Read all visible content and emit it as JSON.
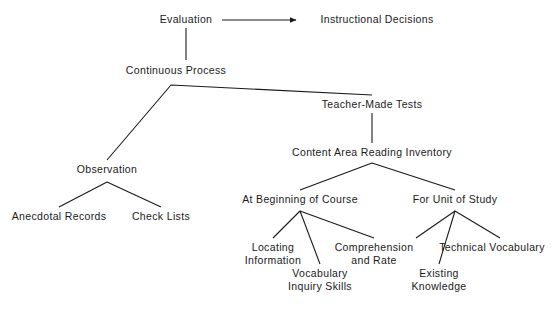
{
  "diagram": {
    "type": "tree-diagram",
    "background_color": "#ffffff",
    "line_color": "#1a1a1a",
    "text_color": "#1a1a1a",
    "nodes": {
      "evaluation": {
        "label": "Evaluation",
        "x": 186,
        "y": 20
      },
      "instructional_decisions": {
        "label": "Instructional Decisions",
        "x": 377,
        "y": 20
      },
      "continuous_process": {
        "label": "Continuous Process",
        "x": 176,
        "y": 71
      },
      "teacher_made_tests": {
        "label": "Teacher-Made Tests",
        "x": 372,
        "y": 105
      },
      "content_area_reading_inventory": {
        "label": "Content Area Reading Inventory",
        "x": 372,
        "y": 153
      },
      "observation": {
        "label": "Observation",
        "x": 107,
        "y": 170
      },
      "anecdotal_records": {
        "label": "Anecdotal Records",
        "x": 59,
        "y": 216
      },
      "check_lists": {
        "label": "Check Lists",
        "x": 161,
        "y": 216
      },
      "at_beginning_of_course": {
        "label": "At Beginning of Course",
        "x": 300,
        "y": 200
      },
      "for_unit_of_study": {
        "label": "For Unit of Study",
        "x": 455,
        "y": 200
      },
      "locating_information": {
        "label_line1": "Locating",
        "label_line2": "Information",
        "x": 273,
        "y": 247
      },
      "comprehension_and_rate": {
        "label_line1": "Comprehension",
        "label_line2": "and Rate",
        "x": 374,
        "y": 247
      },
      "technical_vocabulary": {
        "label_line1": "Technical Vocabulary",
        "label_line2": "",
        "x": 492,
        "y": 247
      },
      "vocabulary_inquiry_skills": {
        "label_line1": "Vocabulary",
        "label_line2": "Inquiry Skills",
        "x": 320,
        "y": 273
      },
      "existing_knowledge": {
        "label_line1": "Existing",
        "label_line2": "Knowledge",
        "x": 439,
        "y": 273
      }
    },
    "connectors": [
      {
        "name": "evaluation-to-instructional-decisions",
        "kind": "arrow",
        "points": "222,20 296,20"
      },
      {
        "name": "evaluation-to-continuous-process",
        "kind": "line",
        "points": "186,28 186,60"
      },
      {
        "name": "continuous-process-to-observation",
        "kind": "line",
        "points": "107,160 171,85"
      },
      {
        "name": "continuous-process-apex-to-teacher-made-tests",
        "kind": "line",
        "points": "171,85 372,95"
      },
      {
        "name": "teacher-made-tests-to-content-area-reading-inventory",
        "kind": "line",
        "points": "372,113 372,143"
      },
      {
        "name": "content-inventory-to-at-beginning",
        "kind": "line",
        "points": "372,163 300,190"
      },
      {
        "name": "content-inventory-to-for-unit",
        "kind": "line",
        "points": "372,163 455,190"
      },
      {
        "name": "observation-to-anecdotal-records",
        "kind": "line",
        "points": "107,182 59,207"
      },
      {
        "name": "observation-to-check-lists",
        "kind": "line",
        "points": "107,182 161,207"
      },
      {
        "name": "at-beginning-to-locating-information",
        "kind": "line",
        "points": "300,211 273,238"
      },
      {
        "name": "at-beginning-to-vocabulary-inquiry-skills",
        "kind": "line",
        "points": "300,211 320,264"
      },
      {
        "name": "at-beginning-to-comprehension-and-rate",
        "kind": "line",
        "points": "300,211 374,238"
      },
      {
        "name": "for-unit-to-comprehension-and-rate",
        "kind": "line",
        "points": "455,211 416,238"
      },
      {
        "name": "for-unit-to-existing-knowledge",
        "kind": "line",
        "points": "455,211 439,264"
      },
      {
        "name": "for-unit-to-technical-vocabulary",
        "kind": "line",
        "points": "455,211 500,238"
      }
    ]
  }
}
